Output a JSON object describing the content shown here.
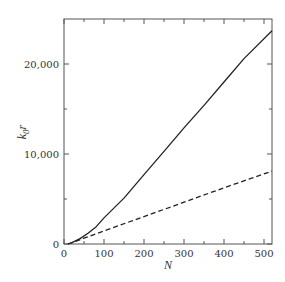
{
  "chart_data": {
    "type": "line",
    "title": "",
    "xlabel": "N",
    "ylabel": "k0 r",
    "ylabel_main": "k",
    "ylabel_sub": "0",
    "ylabel_tail": "r",
    "xlim": [
      0,
      520
    ],
    "ylim": [
      0,
      25000
    ],
    "xticks": [
      0,
      100,
      200,
      300,
      400,
      500
    ],
    "xtick_labels": [
      "0",
      "100",
      "200",
      "300",
      "400",
      "500"
    ],
    "xminor_ticks": [
      50,
      150,
      250,
      350,
      450
    ],
    "yticks": [
      0,
      10000,
      20000
    ],
    "ytick_labels": [
      "0",
      "10,000",
      "20,000"
    ],
    "yminor_ticks": [
      5000,
      15000
    ],
    "grid": false,
    "legend": null,
    "series": [
      {
        "name": "solid",
        "style": "solid",
        "x": [
          10,
          20,
          40,
          60,
          80,
          100,
          150,
          200,
          250,
          300,
          350,
          400,
          450,
          520
        ],
        "y": [
          0,
          150,
          600,
          1200,
          1900,
          2900,
          5100,
          7700,
          10300,
          12900,
          15400,
          18000,
          20600,
          23700
        ]
      },
      {
        "name": "dashed",
        "style": "dashed",
        "x": [
          10,
          20,
          50,
          100,
          200,
          300,
          400,
          520
        ],
        "y": [
          0,
          150,
          650,
          1450,
          3050,
          4650,
          6250,
          8100
        ]
      }
    ]
  }
}
